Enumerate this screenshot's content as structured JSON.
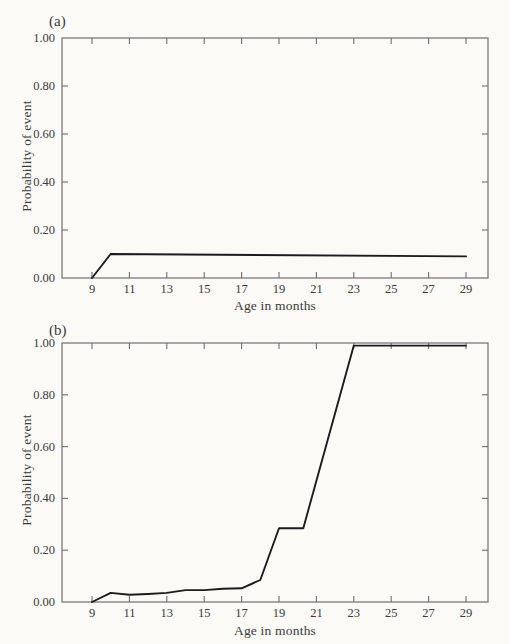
{
  "figure": {
    "background_color": "#fbfaf7",
    "text_color": "#3a3a3a"
  },
  "chart_data": [
    {
      "panel_label": "(a)",
      "type": "line",
      "title": "",
      "xlabel": "Age in months",
      "ylabel": "Probability of event",
      "x_ticks": [
        9,
        11,
        13,
        15,
        17,
        19,
        21,
        23,
        25,
        27,
        29
      ],
      "y_ticks": [
        0,
        0.2,
        0.4,
        0.6,
        0.8,
        1
      ],
      "xlim": [
        7.4,
        30.2
      ],
      "ylim": [
        0,
        1
      ],
      "grid": false,
      "legend": "none",
      "box": true,
      "line_color": "#1c1c1c",
      "axis_color": "#6f6f6f",
      "series": [
        {
          "name": "probability-of-event",
          "points": [
            [
              9,
              0.0
            ],
            [
              10,
              0.1
            ],
            [
              29,
              0.09
            ]
          ]
        }
      ]
    },
    {
      "panel_label": "(b)",
      "type": "line",
      "title": "",
      "xlabel": "Age in months",
      "ylabel": "Probability of event",
      "x_ticks": [
        9,
        11,
        13,
        15,
        17,
        19,
        21,
        23,
        25,
        27,
        29
      ],
      "y_ticks": [
        0,
        0.2,
        0.4,
        0.6,
        0.8,
        1
      ],
      "xlim": [
        7.4,
        30.2
      ],
      "ylim": [
        0,
        1
      ],
      "grid": false,
      "legend": "none",
      "box": true,
      "line_color": "#1c1c1c",
      "axis_color": "#6f6f6f",
      "series": [
        {
          "name": "probability-of-event",
          "points": [
            [
              9,
              0.0
            ],
            [
              10,
              0.035
            ],
            [
              11,
              0.028
            ],
            [
              12,
              0.031
            ],
            [
              13,
              0.035
            ],
            [
              14,
              0.046
            ],
            [
              15,
              0.046
            ],
            [
              16,
              0.051
            ],
            [
              17,
              0.053
            ],
            [
              18,
              0.085
            ],
            [
              19,
              0.285
            ],
            [
              20.3,
              0.285
            ],
            [
              23,
              0.99
            ],
            [
              29,
              0.99
            ]
          ]
        }
      ]
    }
  ]
}
